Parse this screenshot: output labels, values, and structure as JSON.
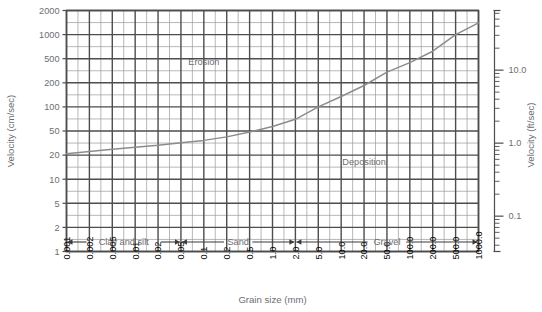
{
  "chart_data": {
    "type": "line",
    "title": "",
    "xlabel": "Grain size (mm)",
    "ylabel": "Velocity (cm/sec)",
    "ylabel_right": "Velocity (ft/sec)",
    "xscale": "log",
    "yscale": "log",
    "grid": true,
    "legend": "none",
    "xlim": [
      0.001,
      1000.0
    ],
    "ylim": [
      1,
      2000
    ],
    "ylim_right": [
      0.0328,
      65.6
    ],
    "x_ticks": [
      "0.001",
      "0.002",
      "0.005",
      "0.01",
      "0.02",
      "0.05",
      "0.1",
      "0.2",
      "0.5",
      "1.0",
      "2.0",
      "5.0",
      "10.0",
      "20.0",
      "50.0",
      "100.0",
      "200.0",
      "500.0",
      "1000.0"
    ],
    "y_ticks": [
      "2000",
      "1000",
      "500",
      "200",
      "100",
      "50",
      "20",
      "10",
      "5",
      "2",
      "1"
    ],
    "y_ticks_right": [
      "100.0",
      "10.0",
      "1.0",
      "0.1"
    ],
    "annotations": [
      {
        "label": "Erosion",
        "x": 0.1,
        "y": 400
      },
      {
        "label": "Deposition",
        "x": 20.0,
        "y": 15
      }
    ],
    "bands": [
      {
        "label": "Clay and silt",
        "from": "0.001",
        "to": "0.05"
      },
      {
        "label": "Sand",
        "from": "0.05",
        "to": "2.0"
      },
      {
        "label": "Gravel",
        "from": "2.0",
        "to": "1000.0"
      }
    ],
    "series": [
      {
        "name": "Critical erosion velocity (Hjulstrom curve)",
        "x": [
          0.001,
          0.002,
          0.005,
          0.01,
          0.02,
          0.05,
          0.1,
          0.2,
          0.5,
          1.0,
          2.0,
          5.0,
          10.0,
          20.0,
          50.0,
          100.0,
          200.0,
          500.0,
          1000.0
        ],
        "y": [
          21,
          23,
          25,
          27,
          29,
          32,
          35,
          40,
          48,
          57,
          70,
          100,
          135,
          185,
          300,
          430,
          620,
          1000,
          1400
        ]
      }
    ]
  },
  "axes": {
    "left_title": "Velocity (cm/sec)",
    "right_title": "Velocity (ft/sec)",
    "bottom_title": "Grain size (mm)"
  },
  "colors": {
    "grid_major": "#4d4d4d",
    "grid_minor": "#9a9a9a",
    "curve": "#8b8c8e",
    "text": "#6d6e71",
    "background": "#ffffff"
  }
}
